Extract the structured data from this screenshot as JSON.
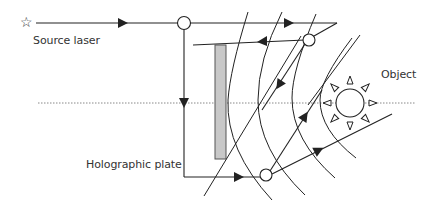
{
  "diagram": {
    "labels": {
      "source_laser": "Source laser",
      "object": "Object",
      "holographic_plate": "Holographic plate"
    },
    "icons": {
      "source": "star-icon",
      "object": "sun-icon"
    },
    "source_star_glyph": "☆",
    "colors": {
      "line": "#333333",
      "plate_fill": "#c8c8c8",
      "plate_stroke": "#555555",
      "axis_dotted": "#888888",
      "background": "#ffffff"
    },
    "components": [
      "source-laser",
      "beam-splitter",
      "mirror-top",
      "mirror-bottom",
      "holographic-plate",
      "object",
      "optical-axis",
      "wavefronts"
    ]
  }
}
